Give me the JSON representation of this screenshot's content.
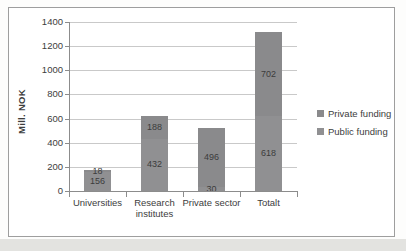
{
  "chart_data": {
    "type": "bar",
    "stacked": true,
    "title": "",
    "ylabel": "Mill. NOK",
    "ylim": [
      0,
      1400
    ],
    "ytick_step": 200,
    "grid": true,
    "categories": [
      "Universities",
      "Research institutes",
      "Private sector",
      "Totalt"
    ],
    "series": [
      {
        "name": "Public funding",
        "values": [
          156,
          432,
          30,
          618
        ],
        "color": "#909092"
      },
      {
        "name": "Private funding",
        "values": [
          18,
          188,
          496,
          702
        ],
        "color": "#8a8a8c"
      }
    ],
    "legend": {
      "position": "right",
      "order": [
        "Private funding",
        "Public funding"
      ]
    }
  },
  "colors": {
    "text": "#3d3d3d",
    "data_label": "#3c3c3c",
    "gridline": "#c9c9c9",
    "axis": "#8c8c8c",
    "frame_border": "#9e9e9e",
    "page_bottom_strip": "#e3e3e0",
    "plot_background": "#ffffff"
  }
}
